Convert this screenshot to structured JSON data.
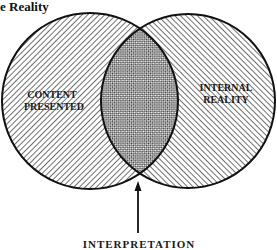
{
  "title": "e Reality",
  "diagram": {
    "type": "venn",
    "left_circle": {
      "label_line1": "CONTENT",
      "label_line2": "PRESENTED",
      "hatch": "forward-diagonal"
    },
    "right_circle": {
      "label_line1": "INTERNAL",
      "label_line2": "REALITY",
      "hatch": "back-diagonal"
    },
    "overlap": {
      "hatch": "crosshatch"
    },
    "arrow_label": "INTERPRETATION"
  },
  "colors": {
    "ink": "#1a1a1a",
    "background": "#ffffff"
  }
}
